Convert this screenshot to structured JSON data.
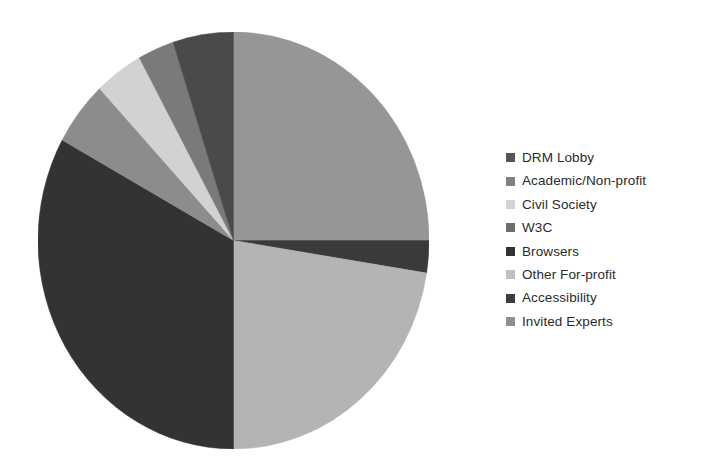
{
  "chart_data": {
    "type": "pie",
    "title": "",
    "subtitle": "",
    "xlabel": "",
    "ylabel": "",
    "grid": false,
    "legend_position": "right",
    "start_angle_deg": 0,
    "direction": "clockwise",
    "categories": [
      "DRM Lobby",
      "Academic/Non-profit",
      "Civil Society",
      "W3C",
      "Browsers",
      "Other For-profit",
      "Accessibility",
      "Invited Experts"
    ],
    "values": [
      25,
      2.5,
      22.5,
      33,
      5,
      4,
      3,
      5
    ],
    "units": "percent",
    "slices": [
      {
        "label": "DRM Lobby",
        "value": 25,
        "angle_deg": 90,
        "color": "#969696"
      },
      {
        "label": "Academic/Non-profit",
        "value": 2.5,
        "angle_deg": 9,
        "color": "#3a3a3a"
      },
      {
        "label": "Civil Society",
        "value": 22.5,
        "angle_deg": 81,
        "color": "#b4b4b4"
      },
      {
        "label": "W3C",
        "value": 33,
        "angle_deg": 118.8,
        "color": "#333333"
      },
      {
        "label": "Browsers",
        "value": 5,
        "angle_deg": 18,
        "color": "#8c8c8c"
      },
      {
        "label": "Other For-profit",
        "value": 4,
        "angle_deg": 14.4,
        "color": "#d2d2d2"
      },
      {
        "label": "Accessibility",
        "value": 3,
        "angle_deg": 10.8,
        "color": "#7a7a7a"
      },
      {
        "label": "Invited Experts",
        "value": 5,
        "angle_deg": 18,
        "color": "#4a4a4a"
      }
    ]
  },
  "legend": {
    "items": [
      {
        "label": "DRM Lobby",
        "color": "#555555"
      },
      {
        "label": "Academic/Non-profit",
        "color": "#808080"
      },
      {
        "label": "Civil Society",
        "color": "#d4d4d4"
      },
      {
        "label": "W3C",
        "color": "#6e6e6e"
      },
      {
        "label": "Browsers",
        "color": "#333333"
      },
      {
        "label": "Other For-profit",
        "color": "#bfbfbf"
      },
      {
        "label": "Accessibility",
        "color": "#3d3d3d"
      },
      {
        "label": "Invited Experts",
        "color": "#8f8f8f"
      }
    ]
  }
}
